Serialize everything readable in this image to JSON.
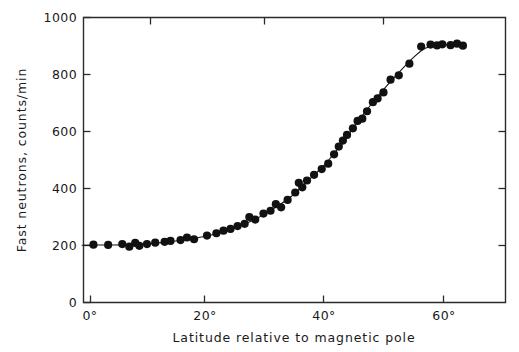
{
  "chart_data": {
    "type": "scatter",
    "title": "",
    "xlabel": "Latitude relative to magnetic pole",
    "ylabel": "Fast neutrons, counts/min",
    "xlim": [
      -3,
      71
    ],
    "ylim": [
      0,
      1000
    ],
    "grid": false,
    "legend": null,
    "xticks": [
      0,
      20,
      40,
      60
    ],
    "xtick_labels": [
      "0°",
      "20°",
      "40°",
      "60°"
    ],
    "yticks": [
      0,
      200,
      400,
      600,
      800,
      1000
    ],
    "ytick_labels": [
      "0",
      "200",
      "400",
      "600",
      "800",
      "1000"
    ],
    "marker": "filled-circle",
    "marker_color": "#111111",
    "line_color": "#141414",
    "points": [
      {
        "x": 0.5,
        "y": 203
      },
      {
        "x": 3.0,
        "y": 202
      },
      {
        "x": 5.4,
        "y": 205
      },
      {
        "x": 6.6,
        "y": 196
      },
      {
        "x": 7.6,
        "y": 209
      },
      {
        "x": 8.3,
        "y": 199
      },
      {
        "x": 9.6,
        "y": 205
      },
      {
        "x": 11.0,
        "y": 210
      },
      {
        "x": 12.6,
        "y": 213
      },
      {
        "x": 13.6,
        "y": 216
      },
      {
        "x": 15.3,
        "y": 219
      },
      {
        "x": 16.4,
        "y": 228
      },
      {
        "x": 17.6,
        "y": 222
      },
      {
        "x": 19.8,
        "y": 235
      },
      {
        "x": 21.4,
        "y": 243
      },
      {
        "x": 22.6,
        "y": 252
      },
      {
        "x": 23.8,
        "y": 258
      },
      {
        "x": 25.0,
        "y": 268
      },
      {
        "x": 26.2,
        "y": 276
      },
      {
        "x": 27.0,
        "y": 300
      },
      {
        "x": 28.0,
        "y": 291
      },
      {
        "x": 29.4,
        "y": 312
      },
      {
        "x": 30.6,
        "y": 322
      },
      {
        "x": 31.5,
        "y": 345
      },
      {
        "x": 32.4,
        "y": 334
      },
      {
        "x": 33.5,
        "y": 360
      },
      {
        "x": 34.8,
        "y": 386
      },
      {
        "x": 35.4,
        "y": 420
      },
      {
        "x": 36.0,
        "y": 404
      },
      {
        "x": 36.8,
        "y": 428
      },
      {
        "x": 38.0,
        "y": 448
      },
      {
        "x": 39.3,
        "y": 468
      },
      {
        "x": 40.4,
        "y": 487
      },
      {
        "x": 41.4,
        "y": 520
      },
      {
        "x": 42.2,
        "y": 547
      },
      {
        "x": 42.9,
        "y": 568
      },
      {
        "x": 43.6,
        "y": 588
      },
      {
        "x": 44.6,
        "y": 611
      },
      {
        "x": 45.4,
        "y": 637
      },
      {
        "x": 46.2,
        "y": 645
      },
      {
        "x": 47.0,
        "y": 671
      },
      {
        "x": 48.0,
        "y": 703
      },
      {
        "x": 48.8,
        "y": 716
      },
      {
        "x": 49.8,
        "y": 737
      },
      {
        "x": 51.0,
        "y": 782
      },
      {
        "x": 52.4,
        "y": 797
      },
      {
        "x": 54.2,
        "y": 838
      },
      {
        "x": 56.2,
        "y": 898
      },
      {
        "x": 57.8,
        "y": 905
      },
      {
        "x": 58.9,
        "y": 902
      },
      {
        "x": 59.8,
        "y": 906
      },
      {
        "x": 61.2,
        "y": 903
      },
      {
        "x": 62.3,
        "y": 908
      },
      {
        "x": 63.3,
        "y": 901
      }
    ],
    "curve": [
      {
        "x": -1.5,
        "y": 201
      },
      {
        "x": 4.0,
        "y": 202
      },
      {
        "x": 8.0,
        "y": 203
      },
      {
        "x": 12.0,
        "y": 210
      },
      {
        "x": 16.0,
        "y": 220
      },
      {
        "x": 20.0,
        "y": 234
      },
      {
        "x": 24.0,
        "y": 257
      },
      {
        "x": 28.0,
        "y": 292
      },
      {
        "x": 31.0,
        "y": 328
      },
      {
        "x": 34.0,
        "y": 370
      },
      {
        "x": 37.0,
        "y": 428
      },
      {
        "x": 40.0,
        "y": 488
      },
      {
        "x": 43.0,
        "y": 566
      },
      {
        "x": 46.0,
        "y": 650
      },
      {
        "x": 49.0,
        "y": 728
      },
      {
        "x": 52.0,
        "y": 798
      },
      {
        "x": 55.0,
        "y": 862
      },
      {
        "x": 57.0,
        "y": 893
      },
      {
        "x": 59.0,
        "y": 902
      },
      {
        "x": 61.5,
        "y": 905
      },
      {
        "x": 63.5,
        "y": 903
      }
    ]
  },
  "axes": {
    "ylabel": "Fast neutrons, counts/min",
    "xlabel": "Latitude relative to magnetic pole",
    "ytick_labels": [
      "1000",
      "800",
      "600",
      "400",
      "200",
      "0"
    ],
    "xtick_labels": [
      "0°",
      "20°",
      "40°",
      "60°"
    ]
  }
}
